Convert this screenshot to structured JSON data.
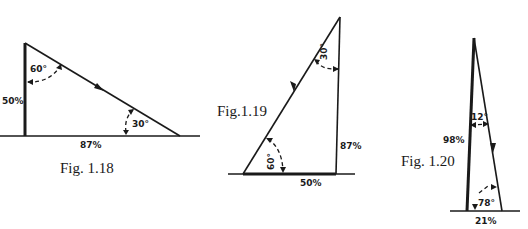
{
  "figures": [
    {
      "caption": "Fig. 1.18",
      "sides": {
        "vertical": "50%",
        "base": "87%"
      },
      "angles": {
        "top": "60°",
        "bottom": "30°"
      },
      "arrow_direction": "down-right along hypotenuse"
    },
    {
      "caption": "Fig.1.19",
      "sides": {
        "vertical": "87%",
        "base": "50%"
      },
      "angles": {
        "top": "30°",
        "bottom": "60°"
      },
      "arrow_direction": "down-left along hypotenuse"
    },
    {
      "caption": "Fig. 1.20",
      "sides": {
        "left": "98%",
        "base": "21%"
      },
      "angles": {
        "top": "12°",
        "bottom": "78°"
      },
      "arrow_direction": "down along right side"
    }
  ]
}
